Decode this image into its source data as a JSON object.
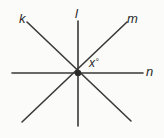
{
  "figure": {
    "background_color": "#fbfbfa",
    "stroke_color": "#3a3a3a",
    "label_color": "#2a2a2a",
    "intersection": {
      "x": 78,
      "y": 73
    },
    "vertex_dot": {
      "radius": 3.2,
      "color": "#2b2b2b"
    },
    "lines": [
      {
        "name": "k",
        "label": "k",
        "orientation": "diagonal-nw-se",
        "x1": 27,
        "y1": 22,
        "x2": 131,
        "y2": 121,
        "stroke_width": 1.6
      },
      {
        "name": "l",
        "label": "l",
        "orientation": "vertical",
        "x1": 78,
        "y1": 21,
        "x2": 78,
        "y2": 126,
        "stroke_width": 1.6
      },
      {
        "name": "m",
        "label": "m",
        "orientation": "diagonal-sw-ne",
        "x1": 22,
        "y1": 122,
        "x2": 127,
        "y2": 22,
        "stroke_width": 1.6
      },
      {
        "name": "n",
        "label": "n",
        "orientation": "horizontal",
        "x1": 12,
        "y1": 73,
        "x2": 143,
        "y2": 73,
        "stroke_width": 1.6
      }
    ],
    "angle": {
      "name": "x",
      "variable": "x",
      "degree_symbol": "°",
      "between_rays": [
        "m-northeast",
        "n-east"
      ],
      "label_x": 89,
      "label_y": 57
    }
  },
  "chart_data": {
    "type": "diagram",
    "xlabel": "",
    "ylabel": "",
    "elements": [
      {
        "kind": "line",
        "label": "k",
        "from": [
          27,
          22
        ],
        "to": [
          131,
          121
        ]
      },
      {
        "kind": "line",
        "label": "l",
        "from": [
          78,
          21
        ],
        "to": [
          78,
          126
        ]
      },
      {
        "kind": "line",
        "label": "m",
        "from": [
          22,
          122
        ],
        "to": [
          127,
          22
        ]
      },
      {
        "kind": "line",
        "label": "n",
        "from": [
          12,
          73
        ],
        "to": [
          143,
          73
        ]
      },
      {
        "kind": "point",
        "label": "intersection",
        "at": [
          78,
          73
        ]
      },
      {
        "kind": "angle",
        "label": "x°",
        "at": [
          98,
          64
        ],
        "between": [
          "m",
          "n"
        ]
      }
    ],
    "labels": [
      "k",
      "l",
      "m",
      "n",
      "x°"
    ],
    "grid": false,
    "legend": "none"
  }
}
